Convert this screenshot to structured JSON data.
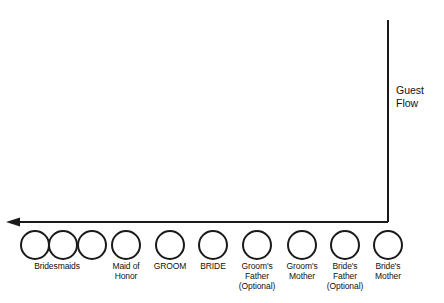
{
  "diagram": {
    "background_color": "#ffffff",
    "line_color": "#1a1a1a",
    "text_color": "#111111",
    "flow": {
      "label": "Guest\nFlow",
      "direction": "right-to-left",
      "arrow_icon": "left-arrow-icon",
      "horizontal_line_y": 222,
      "vertical_line_x": 388,
      "vertical_line_top": 20,
      "arrow_tip_x": 6
    },
    "nodes": [
      {
        "id": "bridesmaid-1",
        "label": "",
        "cx": 35,
        "cy": 245,
        "r": 14
      },
      {
        "id": "bridesmaid-2",
        "label": "",
        "cx": 63,
        "cy": 245,
        "r": 14
      },
      {
        "id": "bridesmaid-3",
        "label": "",
        "cx": 92,
        "cy": 245,
        "r": 14
      },
      {
        "id": "maid-of-honor",
        "label": "",
        "cx": 126,
        "cy": 245,
        "r": 14
      },
      {
        "id": "groom",
        "label": "",
        "cx": 170,
        "cy": 245,
        "r": 14
      },
      {
        "id": "bride",
        "label": "",
        "cx": 213,
        "cy": 245,
        "r": 14
      },
      {
        "id": "grooms-father",
        "label": "",
        "cx": 257,
        "cy": 245,
        "r": 14
      },
      {
        "id": "grooms-mother",
        "label": "",
        "cx": 302,
        "cy": 245,
        "r": 14
      },
      {
        "id": "brides-father",
        "label": "",
        "cx": 345,
        "cy": 245,
        "r": 14
      },
      {
        "id": "brides-mother",
        "label": "",
        "cx": 388,
        "cy": 245,
        "r": 14
      }
    ],
    "labels": [
      {
        "id": "bridesmaids",
        "text": "Bridesmaids",
        "center_x": 57,
        "top": 261,
        "width": 74
      },
      {
        "id": "maid-of-honor",
        "text": "Maid of\nHonor",
        "center_x": 126,
        "top": 261,
        "width": 54
      },
      {
        "id": "groom",
        "text": "GROOM",
        "center_x": 170,
        "top": 261,
        "width": 52
      },
      {
        "id": "bride",
        "text": "BRIDE",
        "center_x": 213,
        "top": 261,
        "width": 46
      },
      {
        "id": "grooms-father",
        "text": "Groom's\nFather\n(Optional)",
        "center_x": 257,
        "top": 261,
        "width": 56
      },
      {
        "id": "grooms-mother",
        "text": "Groom's\nMother",
        "center_x": 302,
        "top": 261,
        "width": 52
      },
      {
        "id": "brides-father",
        "text": "Bride's\nFather\n(Optional)",
        "center_x": 345,
        "top": 261,
        "width": 52
      },
      {
        "id": "brides-mother",
        "text": "Bride's\nMother",
        "center_x": 388,
        "top": 261,
        "width": 50
      }
    ]
  }
}
